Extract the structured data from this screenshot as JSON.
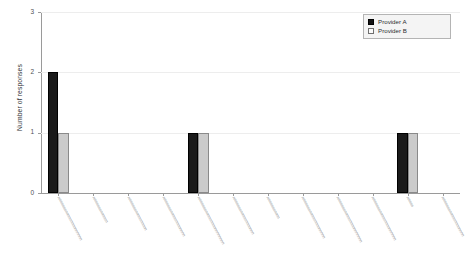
{
  "chart_data": {
    "type": "bar",
    "title": "",
    "subtitle": "",
    "xlabel": "",
    "ylabel": "Number of responses",
    "ylim": [
      0,
      3
    ],
    "ytick_labels": [
      "0",
      "1",
      "2",
      "3"
    ],
    "ytick_values": [
      0,
      1,
      2,
      3
    ],
    "grid": true,
    "grid_axis": "y",
    "legend_position": "top-right",
    "bar_layout": "grouped",
    "categories": [
      "",
      "",
      "",
      "",
      "",
      "",
      "",
      "",
      "",
      "",
      "",
      ""
    ],
    "category_labels_legible": false,
    "category_label_note": "x-axis tick labels are rendered rotated ~62 degrees at sub-pixel text height and are not legible in the source image",
    "series": [
      {
        "name": "Provider A",
        "color": "#1a1a1a",
        "values": [
          2,
          0,
          0,
          0,
          1,
          0,
          0,
          0,
          0,
          0,
          1,
          0
        ]
      },
      {
        "name": "Provider B",
        "color": "#cbcbcb",
        "values": [
          1,
          0,
          0,
          0,
          1,
          0,
          0,
          0,
          0,
          0,
          1,
          0
        ]
      }
    ]
  },
  "legend": {
    "items": [
      {
        "label": "Provider A",
        "swatch": "filled-black-square"
      },
      {
        "label": "Provider B",
        "swatch": "outlined-white-square"
      }
    ]
  },
  "axes": {
    "y_title": "Number of responses",
    "y_ticks": [
      "3",
      "2",
      "1",
      "0"
    ]
  },
  "colors": {
    "series_a": "#1a1a1a",
    "series_b": "#cbcbcb",
    "background": "#ffffff",
    "gridline": "#ededed",
    "axis": "#9a9a9a",
    "text": "#33363a"
  }
}
